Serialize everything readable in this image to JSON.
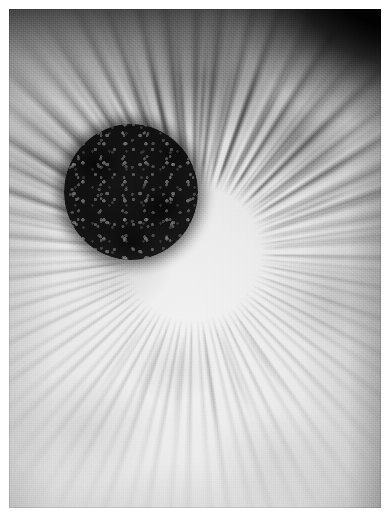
{
  "image": {
    "kind": "photograph",
    "subject": "human-iris-and-pupil",
    "description": "Black-and-white macro photograph of a human eye iris filling the frame, with a large dark circular pupil slightly above and left of centre, radial iris striations fanning outward, and heavy vignetting darkening the top edge and top-right corner to near black.",
    "color_mode": "grayscale",
    "width_px": 391,
    "height_px": 513,
    "border": {
      "present": true,
      "color": "#ffffff",
      "left_px": 9,
      "top_px": 9,
      "right_px": 10,
      "bottom_px": 5
    },
    "palette": {
      "paper_white": "#ffffff",
      "iris_highlight": "#f2f2f2",
      "iris_midtone": "#dcdcdc",
      "iris_shadow": "#9a9a9a",
      "striation_dark": "#5a5a5a",
      "pupil_core": "#101010",
      "pupil_edge": "#2a2a2a",
      "corner_black": "#000000"
    }
  },
  "regions": {
    "pupil": {
      "label": "pupil",
      "shape": "circle",
      "center_x_px": 192,
      "center_y_px": 253,
      "diameter_px": 134,
      "texture": "granular, mottled, with fine lighter speckles",
      "tone": "near-black"
    },
    "iris": {
      "label": "iris stroma",
      "texture": "radial fibres and crypts, cloudy mottling, film grain",
      "tone": "bright light grey, darker toward the top",
      "striation_count_estimate": 46
    },
    "vignette": {
      "label": "vignette",
      "strongest_edge": "top",
      "darkest_corner": "top-right",
      "corner_tone": "black"
    }
  },
  "furrows": [
    {
      "name": "furrow-1",
      "angle_deg": 242,
      "start_px": 78,
      "length_px": 120,
      "opacity": 0.72
    },
    {
      "name": "furrow-2",
      "angle_deg": 250,
      "start_px": 80,
      "length_px": 132,
      "opacity": 0.66
    },
    {
      "name": "furrow-3",
      "angle_deg": 258,
      "start_px": 76,
      "length_px": 140,
      "opacity": 0.8
    },
    {
      "name": "furrow-4",
      "angle_deg": 266,
      "start_px": 74,
      "length_px": 148,
      "opacity": 0.74
    },
    {
      "name": "furrow-5",
      "angle_deg": 274,
      "start_px": 74,
      "length_px": 152,
      "opacity": 0.85
    },
    {
      "name": "furrow-6",
      "angle_deg": 282,
      "start_px": 76,
      "length_px": 144,
      "opacity": 0.7
    },
    {
      "name": "furrow-7",
      "angle_deg": 290,
      "start_px": 78,
      "length_px": 136,
      "opacity": 0.62
    },
    {
      "name": "furrow-8",
      "angle_deg": 298,
      "start_px": 80,
      "length_px": 126,
      "opacity": 0.58
    },
    {
      "name": "furrow-9",
      "angle_deg": 214,
      "start_px": 82,
      "length_px": 108,
      "opacity": 0.55
    },
    {
      "name": "furrow-10",
      "angle_deg": 224,
      "start_px": 80,
      "length_px": 116,
      "opacity": 0.6
    },
    {
      "name": "furrow-11",
      "angle_deg": 312,
      "start_px": 84,
      "length_px": 112,
      "opacity": 0.52
    },
    {
      "name": "furrow-12",
      "angle_deg": 324,
      "start_px": 86,
      "length_px": 104,
      "opacity": 0.46
    },
    {
      "name": "furrow-13",
      "angle_deg": 196,
      "start_px": 88,
      "length_px": 96,
      "opacity": 0.42
    },
    {
      "name": "furrow-14",
      "angle_deg": 338,
      "start_px": 92,
      "length_px": 92,
      "opacity": 0.38
    },
    {
      "name": "furrow-15",
      "angle_deg": 70,
      "start_px": 76,
      "length_px": 110,
      "opacity": 0.26
    },
    {
      "name": "furrow-16",
      "angle_deg": 82,
      "start_px": 76,
      "length_px": 118,
      "opacity": 0.24
    },
    {
      "name": "furrow-17",
      "angle_deg": 96,
      "start_px": 76,
      "length_px": 114,
      "opacity": 0.22
    },
    {
      "name": "furrow-18",
      "angle_deg": 110,
      "start_px": 78,
      "length_px": 104,
      "opacity": 0.2
    },
    {
      "name": "furrow-19",
      "angle_deg": 56,
      "start_px": 78,
      "length_px": 100,
      "opacity": 0.22
    },
    {
      "name": "furrow-20",
      "angle_deg": 124,
      "start_px": 80,
      "length_px": 96,
      "opacity": 0.18
    }
  ]
}
